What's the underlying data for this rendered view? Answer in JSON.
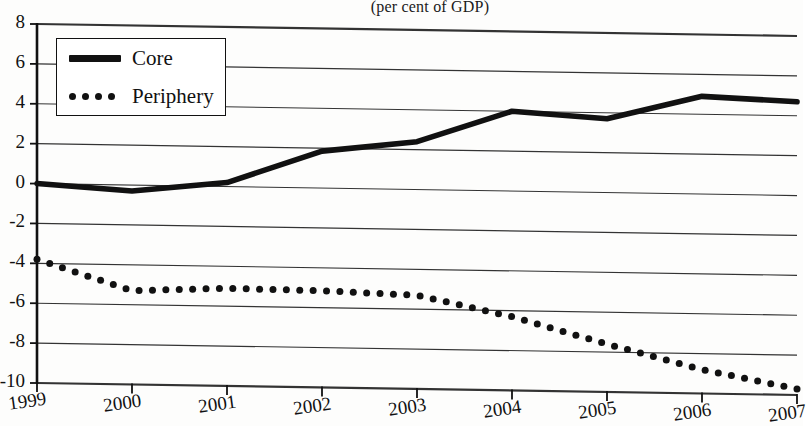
{
  "figure": {
    "subtitle": "(per cent of GDP)"
  },
  "legend": {
    "position": "top-left-inside",
    "items": [
      {
        "label": "Core",
        "marker": "solid-line-icon",
        "color": "#111111"
      },
      {
        "label": "Periphery",
        "marker": "dotted-line-icon",
        "color": "#111111"
      }
    ]
  },
  "chart_data": {
    "type": "line",
    "title": "",
    "subtitle": "(per cent of GDP)",
    "xlabel": "",
    "ylabel": "",
    "xlim": [
      1999,
      2007
    ],
    "ylim": [
      -10,
      8
    ],
    "yticks": [
      8,
      6,
      4,
      2,
      0,
      -2,
      -4,
      -6,
      -8,
      -10
    ],
    "xticks": [
      1999,
      2000,
      2001,
      2002,
      2003,
      2004,
      2005,
      2006,
      2007
    ],
    "xtick_labels": [
      "1999",
      "2000",
      "2001",
      "2002",
      "2003",
      "2004",
      "2005",
      "2006",
      "2007"
    ],
    "ytick_labels": [
      "8",
      "6",
      "4",
      "2",
      "0",
      "-2",
      "-4",
      "-6",
      "-8",
      "-10"
    ],
    "grid": "horizontal",
    "legend_position": "upper left",
    "x": [
      1999,
      2000,
      2001,
      2002,
      2003,
      2004,
      2005,
      2006,
      2007
    ],
    "series": [
      {
        "name": "Core",
        "style": "solid",
        "color": "#111111",
        "values": [
          0.0,
          -0.3,
          0.2,
          1.85,
          2.4,
          4.0,
          3.7,
          4.9,
          4.7
        ]
      },
      {
        "name": "Periphery",
        "style": "dotted",
        "color": "#111111",
        "values": [
          -3.8,
          -5.3,
          -5.1,
          -5.15,
          -5.3,
          -6.3,
          -7.6,
          -8.8,
          -9.7
        ]
      }
    ]
  },
  "axes": {
    "y_tick_labels": [
      "8",
      "6",
      "4",
      "2",
      "0",
      "-2",
      "-4",
      "-6",
      "-8",
      "-10"
    ],
    "x_tick_labels": [
      "1999",
      "2000",
      "2001",
      "2002",
      "2003",
      "2004",
      "2005",
      "2006",
      "2007"
    ]
  },
  "colors": {
    "ink": "#111111",
    "background": "#fdfdfc",
    "gridline": "#333333"
  }
}
